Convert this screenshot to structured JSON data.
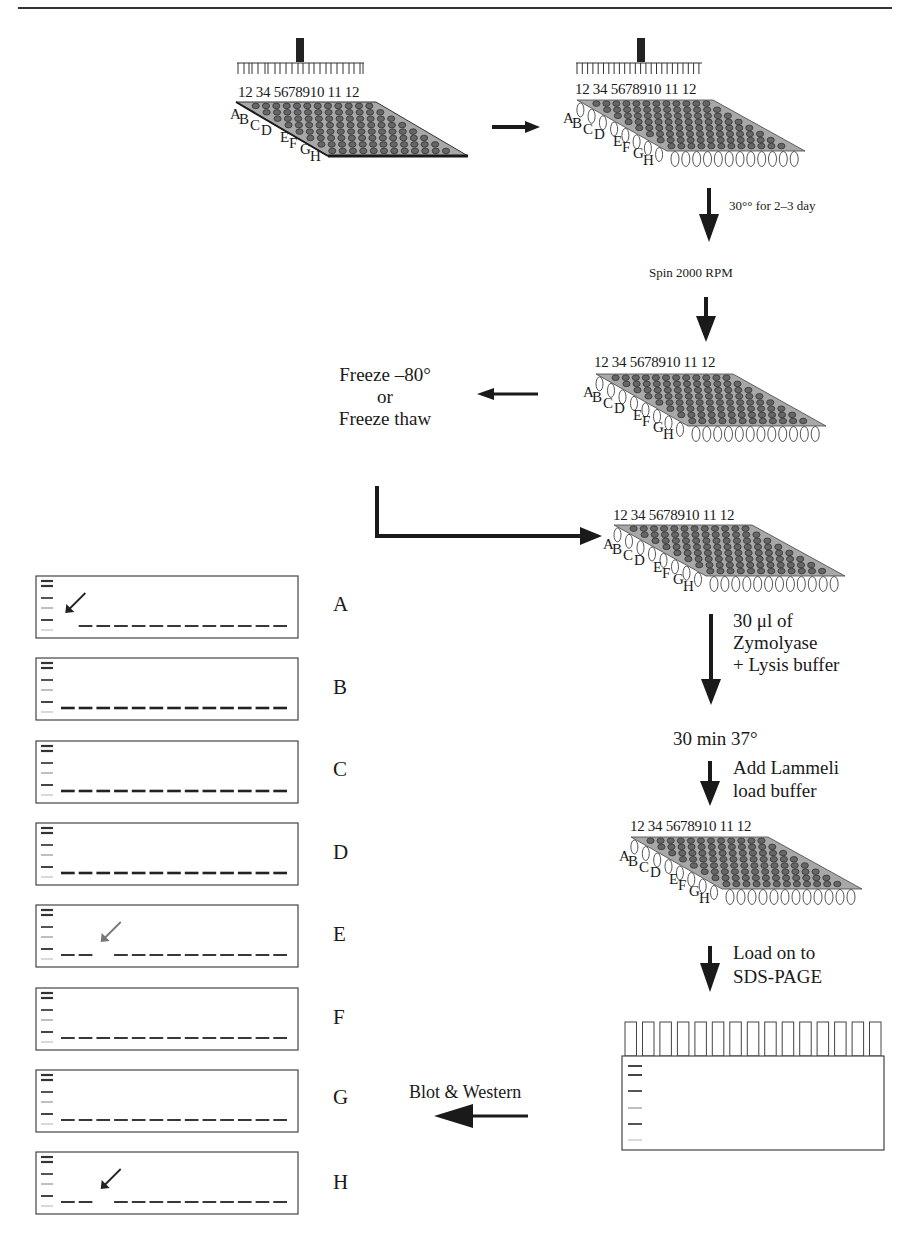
{
  "figure": {
    "top_rule": true,
    "plate": {
      "columns": [
        "1",
        "2",
        "3",
        "4",
        "5",
        "6",
        "7",
        "8",
        "9",
        "10",
        "11",
        "12"
      ],
      "column_label_text": "12 34 5678910 11 12",
      "rows": [
        "A",
        "B",
        "C",
        "D",
        "E",
        "F",
        "G",
        "H"
      ]
    },
    "steps": {
      "incubate": "30°° for 2–3 day",
      "spin": "Spin 2000 RPM",
      "freeze_line1": "Freeze –80°",
      "freeze_line2": "or",
      "freeze_line3": "Freeze thaw",
      "zymo_line1": "30 μl of",
      "zymo_line2": "Zymolyase",
      "zymo_line3": "+ Lysis buffer",
      "incubate2": "30 min 37°",
      "lammeli_line1": "Add Lammeli",
      "lammeli_line2": "load buffer",
      "load_line1": "Load on to",
      "load_line2": "SDS-PAGE",
      "blot": "Blot & Western"
    },
    "blots": [
      {
        "row": "A",
        "lanes": 13,
        "missing_lanes": [
          1
        ],
        "arrow": true,
        "arrow_color": "#222"
      },
      {
        "row": "B",
        "lanes": 13,
        "missing_lanes": [],
        "arrow": false
      },
      {
        "row": "C",
        "lanes": 13,
        "missing_lanes": [],
        "arrow": false
      },
      {
        "row": "D",
        "lanes": 13,
        "missing_lanes": [],
        "arrow": false
      },
      {
        "row": "E",
        "lanes": 13,
        "missing_lanes": [
          3
        ],
        "arrow": true,
        "arrow_color": "#777"
      },
      {
        "row": "F",
        "lanes": 13,
        "missing_lanes": [],
        "arrow": false
      },
      {
        "row": "G",
        "lanes": 13,
        "missing_lanes": [],
        "arrow": false
      },
      {
        "row": "H",
        "lanes": 13,
        "missing_lanes": [
          3
        ],
        "arrow": true,
        "arrow_color": "#222"
      }
    ],
    "gel": {
      "wells": 15,
      "marker_bands": 6
    },
    "colors": {
      "plate_fill": "#a8a8a8",
      "ink": "#1a1a1a",
      "well_dark": "#555555"
    }
  }
}
